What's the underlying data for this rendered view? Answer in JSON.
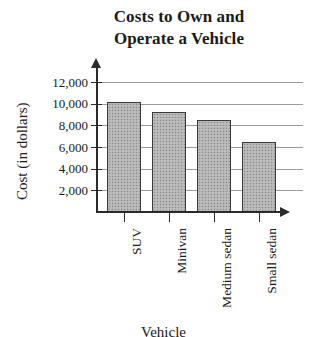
{
  "chart_data": {
    "type": "bar",
    "title": "Costs to Own and Operate a Vehicle",
    "title_lines": [
      "Costs to Own and",
      "Operate a Vehicle"
    ],
    "xlabel": "Vehicle",
    "ylabel": "Cost (in dollars)",
    "categories": [
      "SUV",
      "Minivan",
      "Medium sedan",
      "Small sedan"
    ],
    "values": [
      10200,
      9200,
      8500,
      6500
    ],
    "ylim": [
      0,
      13000
    ],
    "ytick_values": [
      2000,
      4000,
      6000,
      8000,
      10000,
      12000
    ],
    "ytick_labels": [
      "2,000",
      "4,000",
      "6,000",
      "8,000",
      "10,000",
      "12,000"
    ],
    "grid": true,
    "grid_axis": "y",
    "legend": null,
    "bar_fill_color": "#b2b2b2",
    "bar_edge_color": "#3a3a3a",
    "axis_color": "#2b2b2b",
    "gridline_color": "#9a9a9a",
    "background_color": "#ffffff"
  }
}
